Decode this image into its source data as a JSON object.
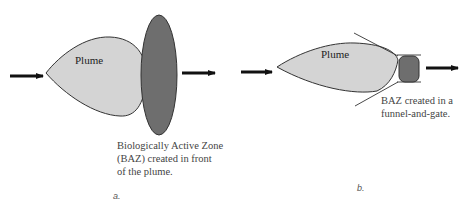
{
  "panel_a": {
    "label": "a.",
    "plume_label": "Plume",
    "caption_lines": [
      "Biologically Active Zone",
      "(BAZ) created in front",
      "of the plume."
    ]
  },
  "panel_b": {
    "label": "b.",
    "plume_label": "Plume",
    "caption_lines": [
      "BAZ created in a",
      "funnel-and-gate."
    ]
  },
  "colors": {
    "plume_fill": "#d4d4d4",
    "baz_fill": "#6e6e6e",
    "outline": "#333333",
    "arrow": "#111111"
  }
}
